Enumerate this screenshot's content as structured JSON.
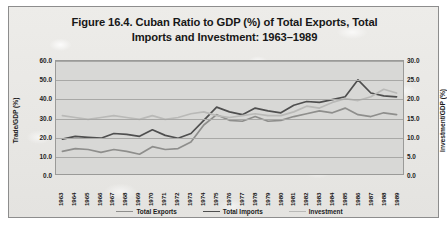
{
  "chart_data": {
    "type": "line",
    "title": "Figure 16.4. Cuban Ratio to GDP (%) of Total Exports, Total Imports and Investment: 1963–1989",
    "title_line1": "Figure 16.4. Cuban Ratio to GDP (%) of Total Exports, Total",
    "title_line2": "Imports and Investment: 1963–1989",
    "xlabel": "",
    "ylabel": "Trade/GDP (%)",
    "ylabel_secondary": "Investment/GDP (%)",
    "ylim": [
      0,
      60
    ],
    "ylim_secondary": [
      0,
      30
    ],
    "yticks": [
      "0.0",
      "10.0",
      "20.0",
      "30.0",
      "40.0",
      "50.0",
      "60.0"
    ],
    "yticks_secondary": [
      "0.0",
      "5.0",
      "10.0",
      "15.0",
      "20.0",
      "25.0",
      "30.0"
    ],
    "grid": true,
    "legend_position": "bottom",
    "categories": [
      "1963",
      "1964",
      "1965",
      "1966",
      "1967",
      "1968",
      "1969",
      "1970",
      "1971",
      "1972",
      "1973",
      "1974",
      "1975",
      "1976",
      "1977",
      "1978",
      "1979",
      "1980",
      "1981",
      "1982",
      "1983",
      "1984",
      "1985",
      "1986",
      "1987",
      "1988",
      "1989"
    ],
    "series": [
      {
        "name": "Total Exports",
        "axis": "left",
        "color": "#8e8e8c",
        "values": [
          12.0,
          13.5,
          13.0,
          11.5,
          13.0,
          12.0,
          10.5,
          14.5,
          13.0,
          13.5,
          17.0,
          26.0,
          31.5,
          28.5,
          28.0,
          30.5,
          28.0,
          28.5,
          30.5,
          32.0,
          33.5,
          32.5,
          35.0,
          31.5,
          30.5,
          32.5,
          31.5
        ]
      },
      {
        "name": "Total Imports",
        "axis": "left",
        "color": "#4f4f4f",
        "values": [
          18.5,
          20.0,
          19.5,
          19.0,
          21.5,
          21.0,
          20.0,
          23.5,
          20.5,
          19.0,
          21.5,
          28.5,
          35.5,
          33.0,
          31.5,
          35.0,
          33.5,
          32.5,
          36.5,
          38.5,
          38.0,
          39.5,
          41.0,
          50.0,
          43.0,
          41.5,
          41.0
        ]
      },
      {
        "name": "Investment",
        "axis": "right",
        "color": "#b9b9b7",
        "values": [
          15.5,
          15.0,
          14.5,
          15.0,
          15.5,
          15.0,
          14.5,
          15.5,
          14.5,
          15.0,
          16.0,
          16.5,
          15.5,
          15.0,
          15.5,
          16.0,
          15.5,
          15.5,
          16.5,
          18.0,
          17.5,
          19.0,
          20.0,
          19.5,
          20.5,
          22.5,
          21.5
        ]
      }
    ]
  },
  "legend": {
    "items": [
      {
        "label": "Total Exports"
      },
      {
        "label": "Total Imports"
      },
      {
        "label": "Investment"
      }
    ]
  }
}
